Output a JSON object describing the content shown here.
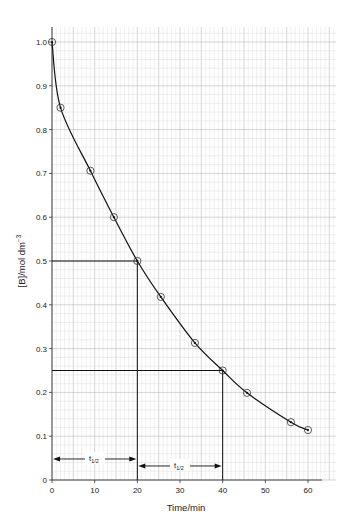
{
  "chart_data": {
    "type": "line",
    "title": "",
    "xlabel": "Time/min",
    "ylabel": "[B]/mol dm⁻³",
    "xlim": [
      0,
      64
    ],
    "ylim": [
      0,
      1.05
    ],
    "xticks": [
      0,
      10,
      20,
      30,
      40,
      50,
      60
    ],
    "yticks": [
      0,
      0.1,
      0.2,
      0.3,
      0.4,
      0.5,
      0.6,
      0.7,
      0.8,
      0.9,
      1.0
    ],
    "xtick_labels": [
      "0",
      "10",
      "20",
      "30",
      "40",
      "50",
      "60"
    ],
    "ytick_labels": [
      "0",
      "0.1",
      "0.2",
      "0.3",
      "0.4",
      "0.5",
      "0.6",
      "0.7",
      "0.8",
      "0.9",
      "1.0"
    ],
    "grid": true,
    "legend": null,
    "series": [
      {
        "name": "[B]",
        "marker": "circle-dot",
        "x": [
          0,
          2,
          9,
          14.5,
          20,
          25.5,
          33.5,
          40,
          45.7,
          56,
          60
        ],
        "y": [
          1.0,
          0.85,
          0.706,
          0.6,
          0.5,
          0.418,
          0.313,
          0.25,
          0.199,
          0.132,
          0.114
        ]
      }
    ],
    "annotations": [
      {
        "type": "hline",
        "y": 0.5,
        "x_from": 0,
        "x_to": 20
      },
      {
        "type": "vline",
        "x": 20,
        "y_from": 0,
        "y_to": 0.5
      },
      {
        "type": "hline",
        "y": 0.25,
        "x_from": 0,
        "x_to": 40
      },
      {
        "type": "vline",
        "x": 40,
        "y_from": 0,
        "y_to": 0.25
      },
      {
        "type": "double-arrow",
        "label": "t₁/₂",
        "x_from": 0,
        "x_to": 20,
        "y": 0.048
      },
      {
        "type": "double-arrow",
        "label": "t₁/₂",
        "x_from": 20,
        "x_to": 40,
        "y": 0.032
      }
    ]
  },
  "labels": {
    "xlabel": "Time/min",
    "ylabel_main": "[B]/mol dm",
    "ylabel_sup": "−3",
    "half_life_1_main": "t",
    "half_life_1_sub": "1/2",
    "half_life_2_main": "t",
    "half_life_2_sub": "1/2"
  },
  "colors": {
    "grid_minor": "#d6d6d6",
    "grid_major": "#b8b8b8",
    "line": "#111111",
    "text": "#222222"
  }
}
